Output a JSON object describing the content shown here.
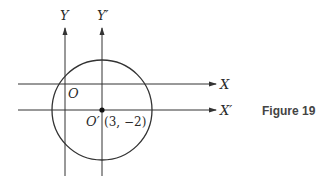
{
  "figure": {
    "caption": "Figure 19",
    "axes": {
      "y_label": "Y",
      "y_prime_label": "Y′",
      "x_label": "X",
      "x_prime_label": "X′"
    },
    "origin_label": "O",
    "new_origin_label": "O′",
    "new_origin_coords": "(3, −2)",
    "colors": {
      "line": "#333333",
      "text": "#2a2a2a",
      "caption": "#444444"
    }
  }
}
